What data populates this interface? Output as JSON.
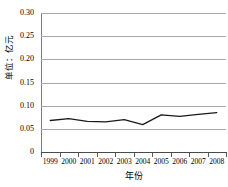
{
  "chart_data": {
    "type": "line",
    "title": "",
    "subtitle": "",
    "xlabel": "年份",
    "ylabel": "单位：亿元",
    "categories": [
      "1999",
      "2000",
      "2001",
      "2002",
      "2003",
      "2004",
      "2005",
      "2006",
      "2007",
      "2008"
    ],
    "series": [
      {
        "name": "",
        "values": [
          0.068,
          0.072,
          0.066,
          0.065,
          0.07,
          0.059,
          0.08,
          0.077,
          0.081,
          0.085
        ]
      }
    ],
    "values": [
      0.068,
      0.072,
      0.066,
      0.065,
      0.07,
      0.059,
      0.08,
      0.077,
      0.081,
      0.085
    ],
    "ylim": [
      0,
      0.3
    ],
    "ytick_values": [
      0,
      0.05,
      0.1,
      0.15,
      0.2,
      0.25,
      0.3
    ],
    "ytick_labels": [
      "0",
      "0.05",
      "0.10",
      "0.15",
      "0.20",
      "0.25",
      "0.30"
    ],
    "grid": true,
    "grid_axis": "y",
    "legend": false,
    "legend_position": "none",
    "line_color": "#1a1a1a",
    "grid_color": "#a8a8a8",
    "axis_color": "#4a4a4a",
    "background_color": "#ffffff",
    "markers": false
  }
}
